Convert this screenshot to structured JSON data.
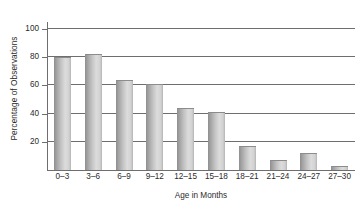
{
  "chart_data": {
    "type": "bar",
    "title": "",
    "xlabel": "Age in Months",
    "ylabel": "Percentage of Observations",
    "categories": [
      "0–3",
      "3–6",
      "6–9",
      "9–12",
      "12–15",
      "15–18",
      "18–21",
      "21–24",
      "24–27",
      "27–30"
    ],
    "values": [
      80,
      82,
      64,
      61,
      44,
      41,
      17,
      7,
      12,
      3
    ],
    "ylim": [
      0,
      105
    ],
    "yticks": [
      20,
      40,
      60,
      80,
      100
    ],
    "ytick_labels": [
      "20",
      "40",
      "60",
      "80",
      "100"
    ],
    "grid": "horizontal",
    "legend": "none",
    "series": [
      {
        "name": "Percentage of Observations",
        "values": [
          80,
          82,
          64,
          61,
          44,
          41,
          17,
          7,
          12,
          3
        ]
      }
    ],
    "colors": {
      "bar_dark": "#8e8e8e",
      "bar_light": "#dcdcdc",
      "axis": "#6e6e6e",
      "text": "#2b2b2b",
      "background": "#ffffff"
    }
  }
}
